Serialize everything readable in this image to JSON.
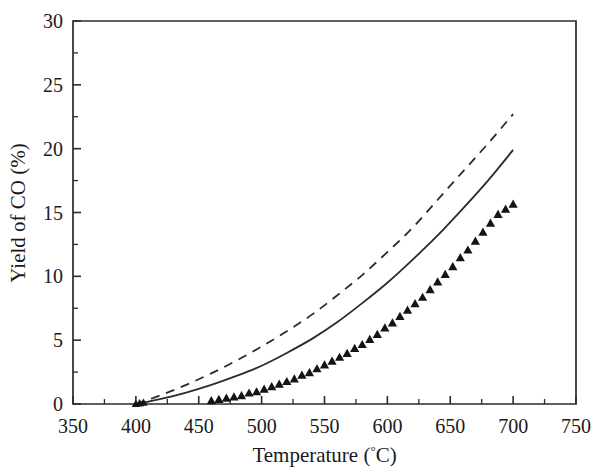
{
  "chart_data": {
    "type": "line",
    "title": "",
    "subtitle": "",
    "xlabel": "Temperature (°C)",
    "ylabel": "Yield of CO (%)",
    "xlim": [
      350,
      750
    ],
    "ylim": [
      0,
      30
    ],
    "xticks": [
      350,
      400,
      450,
      500,
      550,
      600,
      650,
      700,
      750
    ],
    "xtick_labels": [
      "350",
      "400",
      "450",
      "500",
      "550",
      "600",
      "650",
      "700",
      "750"
    ],
    "yticks": [
      0,
      5,
      10,
      15,
      20,
      25,
      30
    ],
    "ytick_labels": [
      "0",
      "5",
      "10",
      "15",
      "20",
      "25",
      "30"
    ],
    "x_minor_step": 25,
    "y_minor_step": 2.5,
    "grid": false,
    "legend": "none",
    "annotations": [],
    "series": [
      {
        "name": "upper-dashed-curve",
        "style": "dashed",
        "marker": "none",
        "color": "#2b2b2b",
        "x": [
          400,
          420,
          440,
          460,
          480,
          500,
          520,
          540,
          560,
          580,
          600,
          620,
          640,
          660,
          680,
          700
        ],
        "values": [
          0.0,
          0.7,
          1.5,
          2.4,
          3.4,
          4.5,
          5.7,
          7.0,
          8.5,
          10.1,
          11.9,
          13.8,
          16.0,
          18.2,
          20.4,
          22.7
        ]
      },
      {
        "name": "middle-solid-curve",
        "style": "solid",
        "marker": "none",
        "color": "#2b2b2b",
        "x": [
          400,
          420,
          440,
          460,
          480,
          500,
          520,
          540,
          560,
          580,
          600,
          620,
          640,
          660,
          680,
          700
        ],
        "values": [
          0.0,
          0.4,
          0.9,
          1.5,
          2.2,
          3.0,
          4.0,
          5.1,
          6.4,
          7.9,
          9.5,
          11.3,
          13.2,
          15.3,
          17.5,
          19.9
        ]
      },
      {
        "name": "lower-triangle-series",
        "style": "markers",
        "marker": "filled-triangle",
        "color": "#141414",
        "x": [
          460,
          466,
          472,
          478,
          484,
          490,
          496,
          502,
          508,
          514,
          520,
          526,
          532,
          538,
          544,
          550,
          556,
          562,
          568,
          574,
          580,
          586,
          592,
          598,
          604,
          610,
          616,
          622,
          628,
          634,
          640,
          646,
          652,
          658,
          664,
          670,
          676,
          682,
          688,
          694,
          700
        ],
        "values": [
          0.3,
          0.4,
          0.5,
          0.6,
          0.7,
          0.9,
          1.0,
          1.2,
          1.4,
          1.6,
          1.8,
          2.0,
          2.3,
          2.5,
          2.8,
          3.1,
          3.4,
          3.7,
          4.0,
          4.4,
          4.7,
          5.1,
          5.5,
          6.0,
          6.4,
          6.9,
          7.4,
          7.9,
          8.4,
          9.0,
          9.6,
          10.2,
          10.8,
          11.5,
          12.1,
          12.8,
          13.5,
          14.2,
          14.9,
          15.3,
          15.7
        ]
      }
    ]
  }
}
